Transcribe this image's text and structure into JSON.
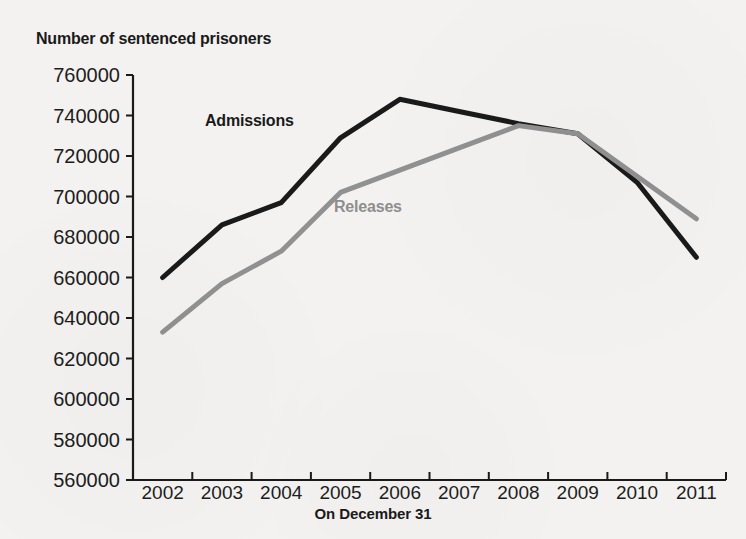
{
  "chart_data": {
    "type": "line",
    "title": "Number of sentenced prisoners",
    "xlabel": "On December 31",
    "ylabel": "",
    "categories": [
      "2002",
      "2003",
      "2004",
      "2005",
      "2006",
      "2007",
      "2008",
      "2009",
      "2010",
      "2011"
    ],
    "ylim": [
      560000,
      760000
    ],
    "ytick_values": [
      760000,
      740000,
      720000,
      700000,
      680000,
      660000,
      640000,
      620000,
      600000,
      580000,
      560000
    ],
    "ytick_labels": [
      "760000",
      "740000",
      "720000",
      "700000",
      "680000",
      "660000",
      "640000",
      "620000",
      "600000",
      "580000",
      "560000"
    ],
    "grid": false,
    "legend_position": "inline-annotations",
    "series": [
      {
        "name": "Admissions",
        "color": "#1a1a1a",
        "values": [
          660000,
          686000,
          697000,
          729000,
          748000,
          742000,
          736000,
          731000,
          707000,
          670000
        ]
      },
      {
        "name": "Releases",
        "color": "#919191",
        "values": [
          633000,
          657000,
          673000,
          702000,
          713000,
          724000,
          735000,
          731000,
          710000,
          689000
        ]
      }
    ],
    "annotations": [
      {
        "text": "Admissions",
        "series": "Admissions"
      },
      {
        "text": "Releases",
        "series": "Releases"
      }
    ]
  }
}
